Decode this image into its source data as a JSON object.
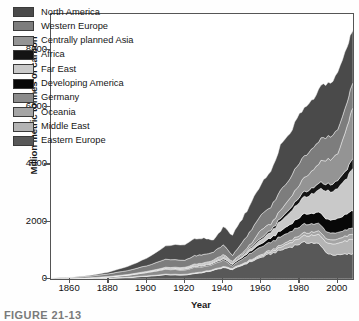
{
  "figure": {
    "caption_partial": "FIGURE 21-13"
  },
  "axes": {
    "y_title": "Million metric tonnes of carbon",
    "x_title": "Year",
    "y_ticks": [
      "0",
      "2000",
      "4000",
      "6000",
      "8000"
    ],
    "x_ticks": [
      "1860",
      "1880",
      "1900",
      "1920",
      "1940",
      "1960",
      "1980",
      "2000"
    ]
  },
  "legend": {
    "items": [
      {
        "label": "North America",
        "color": "#4a4a4a"
      },
      {
        "label": "Western Europe",
        "color": "#7d7d7d"
      },
      {
        "label": "Centrally planned Asia",
        "color": "#949494"
      },
      {
        "label": "Africa",
        "color": "#141414"
      },
      {
        "label": "Far East",
        "color": "#c9c9c9"
      },
      {
        "label": "Developing America",
        "color": "#080808"
      },
      {
        "label": "Germany",
        "color": "#8b8b8b"
      },
      {
        "label": "Oceania",
        "color": "#a5a5a5"
      },
      {
        "label": "Middle East",
        "color": "#b4b4b4"
      },
      {
        "label": "Eastern Europe",
        "color": "#585858"
      }
    ]
  },
  "chart_data": {
    "type": "area",
    "title": "",
    "xlabel": "Year",
    "ylabel": "Million metric tonnes of carbon",
    "xlim": [
      1850,
      2008
    ],
    "ylim": [
      0,
      9250
    ],
    "grid": false,
    "legend_position": "inside-top-left",
    "stacked": true,
    "stack_order_bottom_to_top": [
      "Eastern Europe",
      "Middle East",
      "Oceania",
      "Germany",
      "Developing America",
      "Far East",
      "Africa",
      "Centrally planned Asia",
      "Western Europe",
      "North America"
    ],
    "x": [
      1850,
      1860,
      1870,
      1880,
      1890,
      1900,
      1910,
      1920,
      1925,
      1930,
      1935,
      1940,
      1945,
      1950,
      1955,
      1960,
      1965,
      1970,
      1975,
      1980,
      1985,
      1990,
      1995,
      2000,
      2005,
      2008
    ],
    "series": [
      {
        "name": "North America",
        "color": "#4a4a4a",
        "values": [
          3,
          8,
          23,
          60,
          140,
          260,
          460,
          560,
          580,
          560,
          420,
          610,
          720,
          820,
          960,
          1080,
          1230,
          1550,
          1560,
          1680,
          1700,
          1790,
          1860,
          1950,
          1990,
          1900
        ]
      },
      {
        "name": "Western Europe",
        "color": "#7d7d7d",
        "values": [
          17,
          30,
          55,
          90,
          140,
          200,
          280,
          250,
          290,
          290,
          280,
          330,
          200,
          370,
          470,
          520,
          590,
          680,
          700,
          760,
          760,
          780,
          790,
          830,
          860,
          860
        ]
      },
      {
        "name": "Centrally planned Asia",
        "color": "#949494",
        "values": [
          0,
          1,
          2,
          4,
          6,
          10,
          15,
          20,
          25,
          28,
          32,
          45,
          40,
          50,
          120,
          290,
          210,
          280,
          370,
          440,
          570,
          680,
          880,
          900,
          1480,
          1800
        ]
      },
      {
        "name": "Africa",
        "color": "#141414",
        "values": [
          0,
          0,
          1,
          2,
          4,
          7,
          11,
          15,
          18,
          20,
          22,
          28,
          30,
          35,
          45,
          60,
          75,
          100,
          130,
          180,
          200,
          220,
          240,
          270,
          310,
          340
        ]
      },
      {
        "name": "Far East",
        "color": "#c9c9c9",
        "values": [
          0,
          1,
          2,
          4,
          8,
          14,
          25,
          35,
          45,
          50,
          55,
          75,
          40,
          60,
          90,
          140,
          200,
          330,
          420,
          540,
          640,
          800,
          980,
          1020,
          1280,
          1450
        ]
      },
      {
        "name": "Developing America",
        "color": "#080808",
        "values": [
          0,
          1,
          2,
          3,
          6,
          10,
          16,
          22,
          28,
          32,
          36,
          45,
          50,
          60,
          85,
          115,
          150,
          200,
          260,
          330,
          360,
          400,
          450,
          490,
          560,
          600
        ]
      },
      {
        "name": "Germany",
        "color": "#8b8b8b",
        "values": [
          4,
          10,
          22,
          40,
          70,
          110,
          170,
          150,
          190,
          170,
          180,
          230,
          90,
          170,
          240,
          270,
          280,
          300,
          300,
          310,
          300,
          270,
          240,
          230,
          220,
          215
        ]
      },
      {
        "name": "Oceania",
        "color": "#a5a5a5",
        "values": [
          0,
          1,
          2,
          3,
          5,
          8,
          11,
          13,
          15,
          16,
          17,
          20,
          22,
          25,
          32,
          40,
          50,
          65,
          80,
          95,
          105,
          120,
          135,
          150,
          165,
          175
        ]
      },
      {
        "name": "Middle East",
        "color": "#b4b4b4",
        "values": [
          0,
          0,
          0,
          1,
          2,
          3,
          5,
          7,
          9,
          11,
          13,
          16,
          18,
          22,
          35,
          50,
          70,
          100,
          150,
          200,
          250,
          310,
          360,
          400,
          470,
          520
        ]
      },
      {
        "name": "Eastern Europe",
        "color": "#585858",
        "values": [
          2,
          5,
          12,
          28,
          55,
          95,
          150,
          140,
          190,
          230,
          300,
          400,
          330,
          480,
          620,
          760,
          880,
          1000,
          1120,
          1230,
          1290,
          1220,
          880,
          830,
          870,
          880
        ]
      }
    ],
    "total_note": "Global total rises from near 0 in 1850 to roughly 8200 Mt C by 2008; visible dips around 1930 (Depression) and 1945 (end of WWII)."
  }
}
